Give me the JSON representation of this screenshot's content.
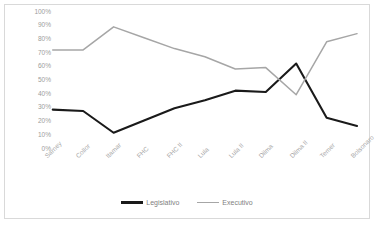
{
  "chart_data": {
    "type": "line",
    "title": "",
    "xlabel": "",
    "ylabel": "",
    "ylim": [
      0,
      100
    ],
    "grid": false,
    "legend_position": "bottom",
    "categories": [
      "Sarney",
      "Collor",
      "Itamar",
      "FHC",
      "FHC II",
      "Lula",
      "Lula II",
      "Dilma",
      "Dilma II",
      "Temer",
      "Bolsonaro"
    ],
    "ytick_labels": [
      "100%",
      "90%",
      "80%",
      "70%",
      "60%",
      "50%",
      "40%",
      "30%",
      "20%",
      "10%",
      "0%"
    ],
    "ytick_values": [
      100,
      90,
      80,
      70,
      60,
      50,
      40,
      30,
      20,
      10,
      0
    ],
    "series": [
      {
        "name": "Legislativo",
        "color": "#1a1a1a",
        "values": [
          28,
          27,
          11,
          20,
          29,
          35,
          42,
          41,
          62,
          22,
          16
        ]
      },
      {
        "name": "Executivo",
        "color": "#a6a6a6",
        "values": [
          72,
          72,
          89,
          81,
          73,
          67,
          58,
          59,
          39,
          78,
          84
        ]
      }
    ]
  },
  "legend": {
    "entries": [
      {
        "label": "Legislativo",
        "color": "#1a1a1a"
      },
      {
        "label": "Executivo",
        "color": "#a6a6a6"
      }
    ]
  },
  "colors": {
    "border": "#d9d9d9",
    "background": "#ffffff",
    "tick_text": "#a6a6a6",
    "legend_text": "#808080"
  }
}
